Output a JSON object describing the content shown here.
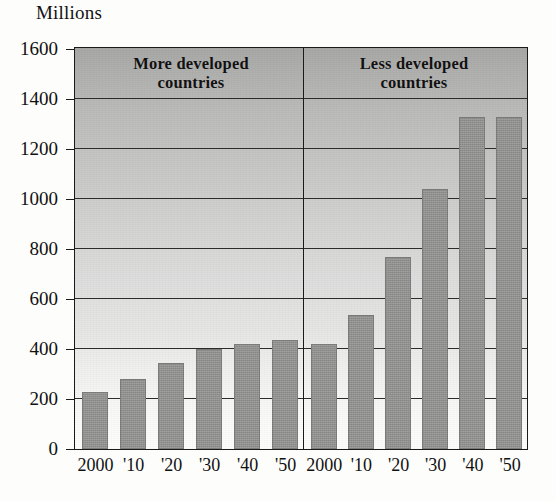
{
  "chart_data": {
    "type": "bar",
    "title": "",
    "ylabel": "Millions",
    "xlabel": "",
    "ylim": [
      0,
      1600
    ],
    "yticks": [
      0,
      200,
      400,
      600,
      800,
      1000,
      1200,
      1400,
      1600
    ],
    "grid": true,
    "legend": "panel-labels",
    "categories": [
      "2000",
      "'10",
      "'20",
      "'30",
      "'40",
      "'50"
    ],
    "panels": [
      {
        "label": "More developed countries",
        "categories": [
          "2000",
          "'10",
          "'20",
          "'30",
          "'40",
          "'50"
        ],
        "values": [
          230,
          280,
          345,
          400,
          420,
          435
        ]
      },
      {
        "label": "Less developed countries",
        "categories": [
          "2000",
          "'10",
          "'20",
          "'30",
          "'40",
          "'50"
        ],
        "values": [
          420,
          535,
          770,
          1040,
          1330,
          1330
        ]
      }
    ],
    "series": [
      {
        "name": "More developed countries",
        "values": [
          230,
          280,
          345,
          400,
          420,
          435
        ]
      },
      {
        "name": "Less developed countries",
        "values": [
          420,
          535,
          770,
          1040,
          1330,
          1330
        ]
      }
    ],
    "colors": {
      "bar": "#8f8f8d",
      "axis": "#1a1a1a",
      "gridline": "#2b2b2b",
      "plot_background_top": "#a8a8a6",
      "plot_background_bottom": "#fdfdfb",
      "text": "#111111"
    }
  },
  "axis": {
    "y_title": "Millions",
    "y_labels": [
      "1600",
      "1400",
      "1200",
      "1000",
      "800",
      "600",
      "400",
      "200",
      "0"
    ],
    "x_labels_left": [
      "2000",
      "'10",
      "'20",
      "'30",
      "'40",
      "'50"
    ],
    "x_labels_right": [
      "2000",
      "'10",
      "'20",
      "'30",
      "'40",
      "'50"
    ]
  },
  "panels": {
    "left_label_line1": "More developed",
    "left_label_line2": "countries",
    "right_label_line1": "Less developed",
    "right_label_line2": "countries"
  }
}
